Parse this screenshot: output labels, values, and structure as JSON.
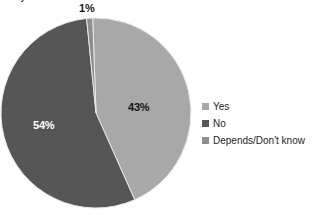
{
  "title": {
    "text_cropped": "Do you think that ... ?"
  },
  "chart_data": {
    "type": "pie",
    "title": "",
    "xlabel": "",
    "ylabel": "",
    "unit": "%",
    "start_angle_deg": -2,
    "direction": "clockwise",
    "categories": [
      "Yes",
      "No",
      "Depends/Don't know"
    ],
    "values": [
      43,
      54,
      1
    ],
    "labels": [
      "43%",
      "54%",
      "1%"
    ],
    "colors": [
      "#a8a8a8",
      "#565656",
      "#8e8e8e"
    ],
    "label_colors": [
      "#121212",
      "#ffffff",
      "#1a1a1a"
    ],
    "legend_position": "right",
    "grid": false,
    "slices": [
      {
        "name": "Yes",
        "value": 43,
        "label": "43%",
        "color": "#a8a8a8"
      },
      {
        "name": "No",
        "value": 54,
        "label": "54%",
        "color": "#565656"
      },
      {
        "name": "Depends/Don't know",
        "value": 1,
        "label": "1%",
        "color": "#8e8e8e"
      }
    ]
  },
  "legend": {
    "items": [
      {
        "label": "Yes",
        "color": "#a8a8a8"
      },
      {
        "label": "No",
        "color": "#565656"
      },
      {
        "label": "Depends/Don't know",
        "color": "#8e8e8e"
      }
    ]
  },
  "labels": {
    "depends": "1%",
    "yes": "43%",
    "no": "54%"
  },
  "style": {
    "background": "#ffffff",
    "slice_border": "#e8e8e8"
  }
}
